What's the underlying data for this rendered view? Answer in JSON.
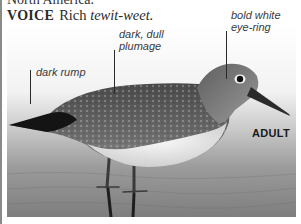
{
  "page": {
    "top_text_cut": "North America.",
    "voice": {
      "label": "VOICE",
      "text": "Rich",
      "call": "tewit-weet."
    }
  },
  "figure": {
    "labels": {
      "rump": "dark rump",
      "plumage_line1": "dark, dull",
      "plumage_line2": "plumage",
      "eye_line1": "bold white",
      "eye_line2": "eye-ring"
    },
    "age_tag": "ADULT",
    "colors": {
      "background_top": "#ffffff",
      "water": "#8c8c8c",
      "plumage": "#5a5a5a",
      "belly": "#ececec",
      "rule": "#8a8a8a"
    }
  }
}
